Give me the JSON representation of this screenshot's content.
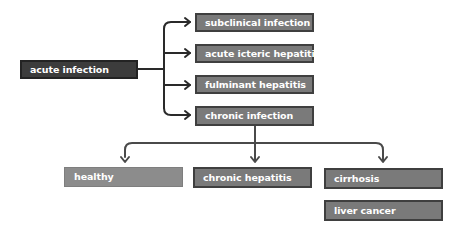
{
  "diagram": {
    "root": {
      "label": "acute infection"
    },
    "outcomes": [
      {
        "label": "subclinical infection"
      },
      {
        "label": "acute icteric hepatitis"
      },
      {
        "label": "fulminant hepatitis"
      },
      {
        "label": "chronic infection"
      }
    ],
    "chronic_outcomes": [
      {
        "label": "healthy"
      },
      {
        "label": "chronic hepatitis"
      },
      {
        "label": "cirrhosis"
      },
      {
        "label": "liver cancer"
      }
    ],
    "colors": {
      "root_fill": "#3c3c3c",
      "box_fill": "#7a7a7a",
      "box_border": "#3f3f3f",
      "light_fill": "#8c8c8c",
      "connector": "#2a2a2a",
      "text": "#ffffff"
    }
  }
}
